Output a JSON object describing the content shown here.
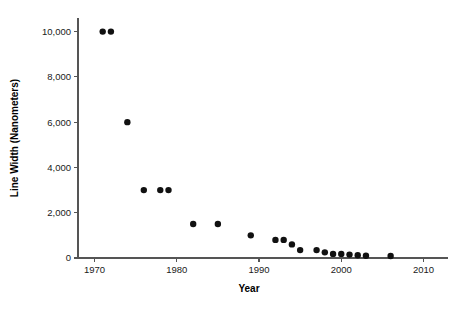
{
  "chart_data": {
    "type": "scatter",
    "title": "",
    "xlabel": "Year",
    "ylabel": "Line Width (Nanometers)",
    "xlim": [
      1968,
      2012
    ],
    "ylim": [
      0,
      10600
    ],
    "grid": false,
    "legend": null,
    "x_ticks": [
      1970,
      1980,
      1990,
      2000,
      2010
    ],
    "x_tick_labels": [
      "1970",
      "1980",
      "1990",
      "2000",
      "2010"
    ],
    "y_ticks": [
      0,
      2000,
      4000,
      6000,
      8000,
      10000
    ],
    "y_tick_labels": [
      "0",
      "2,000",
      "4,000",
      "6,000",
      "8,000",
      "10,000"
    ],
    "marker_color": "#111111",
    "marker_size": 3.2,
    "axis_color": "#555555",
    "background_color": "#ffffff",
    "x": [
      1971,
      1972,
      1974,
      1976,
      1978,
      1979,
      1982,
      1985,
      1989,
      1992,
      1993,
      1994,
      1995,
      1997,
      1998,
      1999,
      2000,
      2001,
      2002,
      2003,
      2006
    ],
    "y": [
      10000,
      10000,
      6000,
      3000,
      3000,
      3000,
      1500,
      1500,
      1000,
      800,
      800,
      600,
      350,
      350,
      250,
      180,
      180,
      150,
      120,
      100,
      90
    ],
    "points": [
      {
        "year": 1971,
        "line_width": 10000
      },
      {
        "year": 1972,
        "line_width": 10000
      },
      {
        "year": 1974,
        "line_width": 6000
      },
      {
        "year": 1976,
        "line_width": 3000
      },
      {
        "year": 1978,
        "line_width": 3000
      },
      {
        "year": 1979,
        "line_width": 3000
      },
      {
        "year": 1982,
        "line_width": 1500
      },
      {
        "year": 1985,
        "line_width": 1500
      },
      {
        "year": 1989,
        "line_width": 1000
      },
      {
        "year": 1992,
        "line_width": 800
      },
      {
        "year": 1993,
        "line_width": 800
      },
      {
        "year": 1994,
        "line_width": 600
      },
      {
        "year": 1995,
        "line_width": 350
      },
      {
        "year": 1997,
        "line_width": 350
      },
      {
        "year": 1998,
        "line_width": 250
      },
      {
        "year": 1999,
        "line_width": 180
      },
      {
        "year": 2000,
        "line_width": 180
      },
      {
        "year": 2001,
        "line_width": 150
      },
      {
        "year": 2002,
        "line_width": 120
      },
      {
        "year": 2003,
        "line_width": 100
      },
      {
        "year": 2006,
        "line_width": 90
      }
    ]
  },
  "layout": {
    "plot_left": 78,
    "plot_right": 440,
    "plot_top": 18,
    "plot_bottom": 258,
    "x_axis_extend": 448,
    "y_axis_top": 18,
    "tick_len": 4,
    "x_label_y": 292,
    "x_tick_label_y": 273,
    "y_label_x": 18
  }
}
